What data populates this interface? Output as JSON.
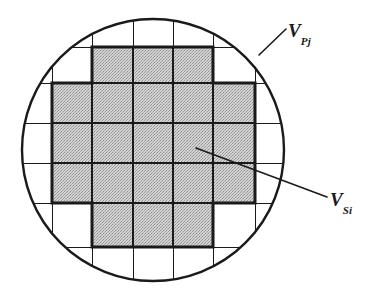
{
  "figure": {
    "kind": "wafer-die-map-diagram",
    "background_color": "#ffffff",
    "line_color": "#1a1a1a",
    "shade_color": "#c9c9c9",
    "wafer": {
      "name": "wafer-outline",
      "center_x": 153,
      "center_y": 150,
      "radius": 132,
      "stroke_width": 2.4
    },
    "grid": {
      "name": "die-grid",
      "vertical_lines_x": [
        52,
        92,
        133,
        173,
        213,
        255
      ],
      "horizontal_lines_y": [
        47,
        83,
        123,
        163,
        203,
        247
      ],
      "stroke_width": 1.0
    },
    "selected_region": {
      "name": "shaded-die-region",
      "description": "stair-stepped octagonal set of fully-printed dies",
      "stroke_width": 3.0,
      "fill": "#c9c9c9",
      "outline_points": [
        [
          92,
          47
        ],
        [
          213,
          47
        ],
        [
          213,
          83
        ],
        [
          255,
          83
        ],
        [
          255,
          203
        ],
        [
          213,
          203
        ],
        [
          213,
          247
        ],
        [
          92,
          247
        ],
        [
          92,
          203
        ],
        [
          52,
          203
        ],
        [
          52,
          83
        ],
        [
          92,
          83
        ]
      ]
    },
    "leaders": [
      {
        "name": "leader-vpj",
        "from_x": 286,
        "from_y": 30,
        "to_x": 258,
        "to_y": 56
      },
      {
        "name": "leader-vsi",
        "from_x": 328,
        "from_y": 196,
        "to_x": 196,
        "to_y": 148
      }
    ]
  },
  "labels": {
    "vpj": {
      "base": "V",
      "sub": "Pj",
      "full": "V_Pj"
    },
    "vsi": {
      "base": "V",
      "sub": "Si",
      "full": "V_Si"
    }
  }
}
